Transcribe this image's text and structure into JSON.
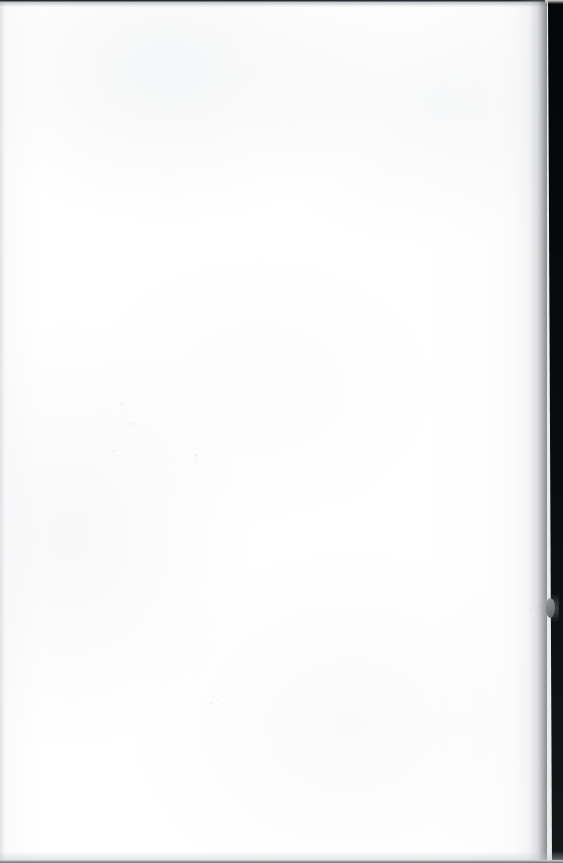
{
  "document": {
    "kind": "scanned-page",
    "page_content_text": "",
    "page_state": "blank",
    "caption": ""
  },
  "canvas": {
    "width": 563,
    "height": 863,
    "paper_color": "#ffffff",
    "paper_tint": "#f7f8f9"
  },
  "artifacts": {
    "top_edge": {
      "name": "top-scan-edge-line",
      "color": "#181a1c",
      "thickness_px": 2
    },
    "bottom_edge": {
      "name": "bottom-scan-edge-line",
      "color": "#8f9296",
      "thickness_px": 3
    },
    "left_edge": {
      "name": "left-margin-band",
      "color": "#dee0e2",
      "thickness_px": 5
    },
    "binding_gutter": {
      "name": "right-binding-gutter",
      "color": "#050607",
      "width_px": 16,
      "shadow_color": "#3c3f42",
      "shadow_width_px": 30
    },
    "edge_notch": {
      "name": "right-edge-paper-notch",
      "color": "#7d8084",
      "x_px": 548,
      "y_px": 598,
      "width_px": 9,
      "height_px": 20
    },
    "speckles": [
      {
        "x": 121,
        "y": 404,
        "r": 1.1,
        "o": 0.2
      },
      {
        "x": 126,
        "y": 411,
        "r": 0.9,
        "o": 0.16
      },
      {
        "x": 133,
        "y": 424,
        "r": 1.4,
        "o": 0.22
      },
      {
        "x": 138,
        "y": 428,
        "r": 1.0,
        "o": 0.18
      },
      {
        "x": 142,
        "y": 426,
        "r": 0.8,
        "o": 0.14
      },
      {
        "x": 114,
        "y": 451,
        "r": 1.2,
        "o": 0.2
      },
      {
        "x": 131,
        "y": 450,
        "r": 1.0,
        "o": 0.15
      },
      {
        "x": 151,
        "y": 452,
        "r": 0.8,
        "o": 0.12
      },
      {
        "x": 196,
        "y": 455,
        "r": 1.3,
        "o": 0.26
      },
      {
        "x": 196,
        "y": 461,
        "r": 1.0,
        "o": 0.2
      },
      {
        "x": 211,
        "y": 703,
        "r": 1.3,
        "o": 0.22
      },
      {
        "x": 218,
        "y": 700,
        "r": 1.1,
        "o": 0.2
      },
      {
        "x": 223,
        "y": 705,
        "r": 0.9,
        "o": 0.16
      },
      {
        "x": 192,
        "y": 708,
        "r": 0.8,
        "o": 0.12
      },
      {
        "x": 291,
        "y": 567,
        "r": 1.0,
        "o": 0.14
      },
      {
        "x": 304,
        "y": 572,
        "r": 0.9,
        "o": 0.12
      },
      {
        "x": 360,
        "y": 31,
        "r": 1.0,
        "o": 0.13
      },
      {
        "x": 474,
        "y": 98,
        "r": 1.1,
        "o": 0.14
      },
      {
        "x": 466,
        "y": 285,
        "r": 0.9,
        "o": 0.12
      },
      {
        "x": 64,
        "y": 106,
        "r": 0.9,
        "o": 0.11
      },
      {
        "x": 97,
        "y": 186,
        "r": 1.0,
        "o": 0.12
      },
      {
        "x": 7,
        "y": 248,
        "r": 1.0,
        "o": 0.13
      },
      {
        "x": 259,
        "y": 720,
        "r": 0.8,
        "o": 0.1
      },
      {
        "x": 421,
        "y": 617,
        "r": 0.9,
        "o": 0.11
      },
      {
        "x": 531,
        "y": 609,
        "r": 1.2,
        "o": 0.18
      },
      {
        "x": 539,
        "y": 606,
        "r": 1.0,
        "o": 0.16
      }
    ]
  }
}
